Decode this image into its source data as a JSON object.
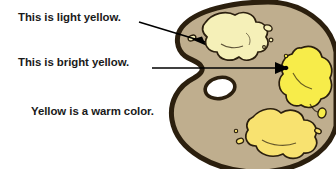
{
  "illustration": {
    "subject": "artist-paint-palette",
    "palette_body_color": "#bfae8e",
    "palette_outline_color": "#2b1f0e",
    "thumb_hole_color": "#ffffff",
    "background_color": "#ffffff",
    "text_color": "#1a1a1a"
  },
  "labels": {
    "light_yellow": "This is light yellow.",
    "bright_yellow": "This is bright yellow.",
    "warm_color": "Yellow is a warm color."
  },
  "paint_blobs": [
    {
      "name": "light-yellow-blob",
      "color": "#f5f0b8",
      "labelled": "This is light yellow."
    },
    {
      "name": "bright-yellow-blob",
      "color": "#f7ec4a",
      "labelled": "This is bright yellow."
    },
    {
      "name": "medium-yellow-blob",
      "color": "#f8e270",
      "labelled": ""
    }
  ]
}
